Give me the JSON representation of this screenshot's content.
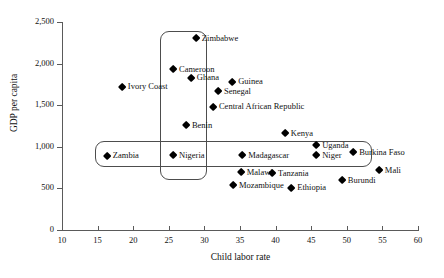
{
  "chart_data": {
    "type": "scatter",
    "title": "",
    "xlabel": "Child labor rate",
    "ylabel": "GDP per capita",
    "xlim": [
      10,
      60
    ],
    "ylim": [
      0,
      2500
    ],
    "xticks": [
      10,
      15,
      20,
      25,
      30,
      35,
      40,
      45,
      50,
      55,
      60
    ],
    "xtick_labels": [
      "10",
      "15",
      "20",
      "25",
      "30",
      "35",
      "40",
      "45",
      "50",
      "55",
      "60"
    ],
    "yticks": [
      0,
      500,
      1000,
      1500,
      2000,
      2500
    ],
    "ytick_labels": [
      "0",
      "500",
      "1,000",
      "1,500",
      "2,000",
      "2,500"
    ],
    "grid": false,
    "legend": false,
    "marker": "filled-diamond",
    "marker_color": "#000000",
    "points": [
      {
        "label": "Zimbabwe",
        "x": 28.8,
        "y": 2300,
        "label_pos": "right"
      },
      {
        "label": "Cameroon",
        "x": 25.6,
        "y": 1935,
        "label_pos": "right"
      },
      {
        "label": "Ghana",
        "x": 28.1,
        "y": 1830,
        "label_pos": "right"
      },
      {
        "label": "Ivory Coast",
        "x": 18.4,
        "y": 1720,
        "label_pos": "right"
      },
      {
        "label": "Guinea",
        "x": 33.9,
        "y": 1780,
        "label_pos": "right"
      },
      {
        "label": "Senegal",
        "x": 31.9,
        "y": 1670,
        "label_pos": "right"
      },
      {
        "label": "Central African Republic",
        "x": 31.2,
        "y": 1480,
        "label_pos": "right"
      },
      {
        "label": "Benin",
        "x": 27.4,
        "y": 1255,
        "label_pos": "right"
      },
      {
        "label": "Kenya",
        "x": 41.3,
        "y": 1165,
        "label_pos": "right"
      },
      {
        "label": "Uganda",
        "x": 45.7,
        "y": 1020,
        "label_pos": "right"
      },
      {
        "label": "Niger",
        "x": 45.7,
        "y": 900,
        "label_pos": "right"
      },
      {
        "label": "Burkina Faso",
        "x": 50.9,
        "y": 935,
        "label_pos": "right"
      },
      {
        "label": "Madagascar",
        "x": 35.3,
        "y": 900,
        "label_pos": "right"
      },
      {
        "label": "Nigeria",
        "x": 25.6,
        "y": 895,
        "label_pos": "right"
      },
      {
        "label": "Zambia",
        "x": 16.3,
        "y": 890,
        "label_pos": "right"
      },
      {
        "label": "Mali",
        "x": 54.5,
        "y": 720,
        "label_pos": "right"
      },
      {
        "label": "Malawi",
        "x": 35.1,
        "y": 695,
        "label_pos": "right"
      },
      {
        "label": "Tanzania",
        "x": 39.5,
        "y": 685,
        "label_pos": "right"
      },
      {
        "label": "Burundi",
        "x": 49.3,
        "y": 600,
        "label_pos": "right"
      },
      {
        "label": "Mozambique",
        "x": 34.0,
        "y": 540,
        "label_pos": "right"
      },
      {
        "label": "Ethiopia",
        "x": 42.2,
        "y": 505,
        "label_pos": "right"
      }
    ],
    "annotations": [
      {
        "name": "vertical-highlight-box",
        "shape": "rounded-rectangle",
        "x_range": [
          23.8,
          30.4
        ],
        "y_range": [
          595,
          2390
        ]
      },
      {
        "name": "horizontal-highlight-box",
        "shape": "rounded-rectangle",
        "x_range": [
          14.6,
          53.5
        ],
        "y_range": [
          755,
          1065
        ]
      }
    ]
  }
}
